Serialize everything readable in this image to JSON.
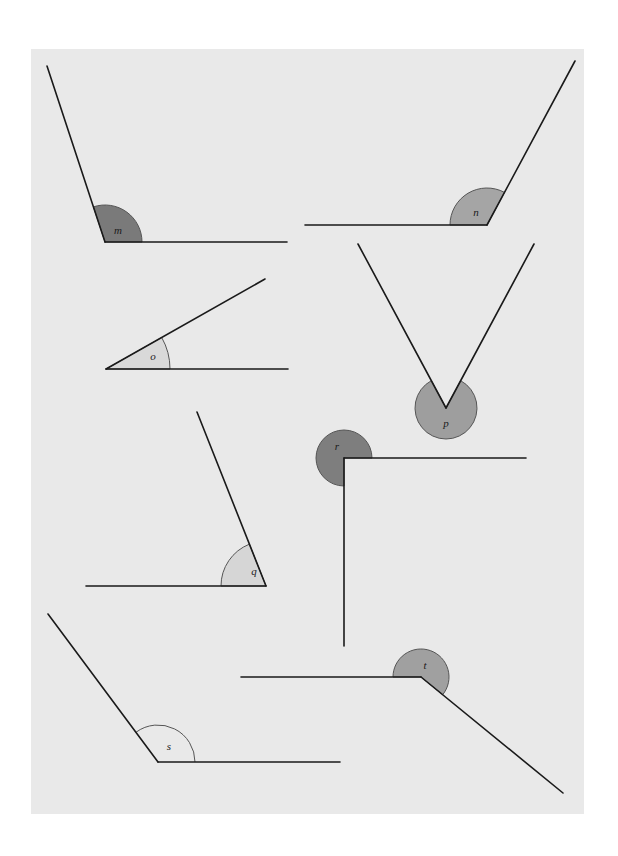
{
  "panel": {
    "x": 31,
    "y": 49,
    "width": 553,
    "height": 765,
    "color": "#e9e9e9"
  },
  "angles": [
    {
      "label": "m",
      "vertex": [
        105,
        242
      ],
      "ray1_end": [
        47,
        66
      ],
      "ray2_end": [
        287,
        242
      ],
      "radius": 37,
      "fill": "#7a7a7a",
      "type": "sector",
      "label_pos": [
        118,
        231
      ]
    },
    {
      "label": "n",
      "vertex": [
        487,
        225
      ],
      "ray1_end": [
        305,
        225
      ],
      "ray2_end": [
        575,
        61
      ],
      "radius": 37,
      "fill": "#a5a5a5",
      "type": "sector",
      "label_pos": [
        476,
        213
      ]
    },
    {
      "label": "o",
      "vertex": [
        106,
        369
      ],
      "ray1_end": [
        288,
        369
      ],
      "ray2_end": [
        265,
        279
      ],
      "radius": 64,
      "fill": "#d9d9d9",
      "type": "sector",
      "label_pos": [
        153,
        357
      ]
    },
    {
      "label": "p",
      "vertex": [
        446,
        408
      ],
      "ray1_end": [
        358,
        244
      ],
      "ray2_end": [
        534,
        244
      ],
      "radius": 31,
      "fill": "#9e9e9e",
      "type": "reflex",
      "label_pos": [
        446,
        424
      ]
    },
    {
      "label": "r",
      "vertex": [
        344,
        458
      ],
      "ray1_end": [
        526,
        458
      ],
      "ray2_end": [
        344,
        646
      ],
      "radius": 28,
      "fill": "#7e7e7e",
      "type": "reflex",
      "label_pos": [
        337,
        447
      ]
    },
    {
      "label": "q",
      "vertex": [
        266,
        586
      ],
      "ray1_end": [
        86,
        586
      ],
      "ray2_end": [
        197,
        412
      ],
      "radius": 45,
      "fill": "#d6d6d6",
      "type": "sector",
      "label_pos": [
        254,
        572
      ]
    },
    {
      "label": "s",
      "vertex": [
        158,
        762
      ],
      "ray1_end": [
        48,
        614
      ],
      "ray2_end": [
        340,
        762
      ],
      "radius": 37,
      "fill": "none",
      "type": "sector",
      "label_pos": [
        169,
        747
      ]
    },
    {
      "label": "t",
      "vertex": [
        421,
        677
      ],
      "ray1_end": [
        241,
        677
      ],
      "ray2_end": [
        563,
        793
      ],
      "radius": 28,
      "fill": "#a0a0a0",
      "type": "reflex",
      "label_pos": [
        425,
        666
      ]
    }
  ]
}
